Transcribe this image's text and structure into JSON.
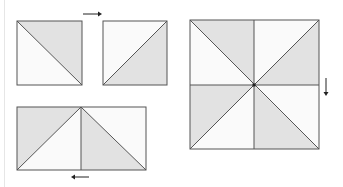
{
  "diagram": {
    "colors": {
      "shaded": "#e2e2e2",
      "light": "#fafafa",
      "stroke": "#555555",
      "arrow": "#222222",
      "margin_line": "#e6e6e6"
    },
    "units": [
      {
        "id": "hst-1",
        "label": "half-square triangle, diagonal top-left to bottom-right, shaded upper-right"
      },
      {
        "id": "hst-2",
        "label": "half-square triangle, diagonal bottom-left to top-right, shaded lower-right"
      },
      {
        "id": "pair",
        "label": "two half-square triangles joined side by side"
      },
      {
        "id": "pinwheel",
        "label": "four-patch pinwheel block"
      }
    ],
    "arrows": [
      {
        "id": "arrow-right",
        "direction": "right"
      },
      {
        "id": "arrow-left",
        "direction": "left"
      },
      {
        "id": "arrow-down",
        "direction": "down"
      }
    ]
  }
}
